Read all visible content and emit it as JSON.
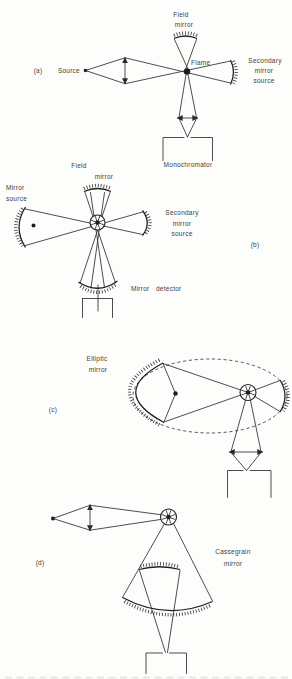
{
  "figure": {
    "background": "#fdfdfc",
    "ink_color": "#2e2e2e",
    "panels": {
      "a": {
        "tag": "(a)",
        "labels": {
          "field_mirror_l1": "Field",
          "field_mirror_l2": "mirror",
          "source": "Source",
          "flame": "Flame",
          "secondary_l1": "Secondary",
          "secondary_l2": "mirror",
          "secondary_l3": "source",
          "monochromator": "Monochromator"
        }
      },
      "b": {
        "tag": "(b)",
        "labels": {
          "field_l1": "Field",
          "field_l2": "mirror",
          "mirror_source_l1": "Mirror",
          "mirror_source_l2": "source",
          "secondary_l1": "Secondary",
          "secondary_l2": "mirror",
          "secondary_l3": "source",
          "detector_l1": "Mirror",
          "detector_l2": "detector"
        }
      },
      "c": {
        "tag": "(c)",
        "labels": {
          "elliptic_l1": "Elliptic",
          "elliptic_l2": "mirror"
        }
      },
      "d": {
        "tag": "(d)",
        "labels": {
          "cassegrain_l1": "Cassegrain",
          "cassegrain_l2": "mirror"
        }
      }
    }
  }
}
